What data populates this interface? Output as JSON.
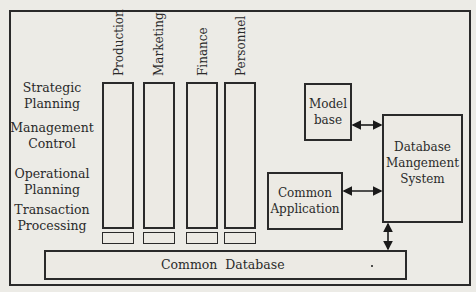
{
  "columns": [
    {
      "label": "Production"
    },
    {
      "label": "Marketing"
    },
    {
      "label": "Finance"
    },
    {
      "label": "Personnel"
    }
  ],
  "rows": [
    {
      "line1": "Strategic",
      "line2": "Planning"
    },
    {
      "line1": "Management",
      "line2": "Control"
    },
    {
      "line1": "Operational",
      "line2": "Planning"
    },
    {
      "line1": "Transaction",
      "line2": "Processing"
    }
  ],
  "boxes": {
    "common_database": "Common  Database",
    "model_base_1": "Model",
    "model_base_2": "base",
    "dbms_1": "Database",
    "dbms_2": "Mangement",
    "dbms_3": "System",
    "common_app_1": "Common",
    "common_app_2": "Application"
  }
}
